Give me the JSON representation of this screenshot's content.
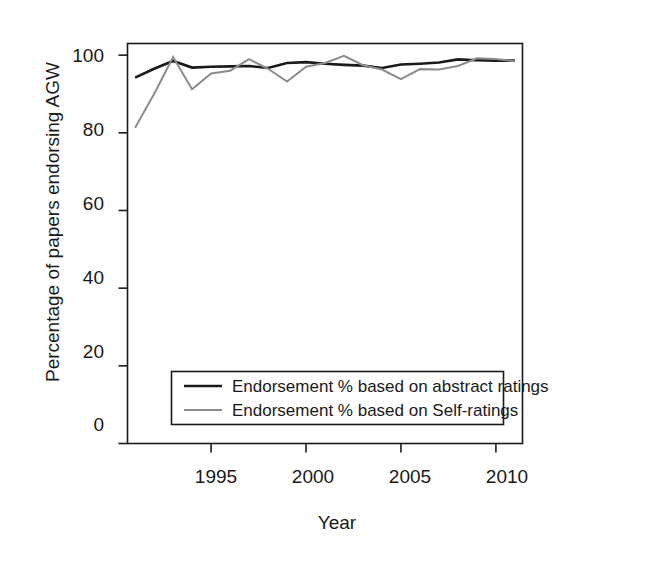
{
  "chart_data": {
    "type": "line",
    "title": "",
    "xlabel": "Year",
    "ylabel": "Percentage of papers endorsing AGW",
    "xlim": [
      1990.6,
      2011.4
    ],
    "ylim": [
      0,
      103
    ],
    "xticks": [
      1995,
      2000,
      2005,
      2010
    ],
    "yticks": [
      0,
      20,
      40,
      60,
      80,
      100
    ],
    "grid": false,
    "legend_position": "lower-center",
    "x": [
      1991,
      1992,
      1993,
      1994,
      1995,
      1996,
      1997,
      1998,
      1999,
      2000,
      2001,
      2002,
      2003,
      2004,
      2005,
      2006,
      2007,
      2008,
      2009,
      2010,
      2011
    ],
    "series": [
      {
        "name": "Endorsement % based on abstract ratings",
        "color": "#1a1a1a",
        "values": [
          94.2,
          96.5,
          98.5,
          96.8,
          97.0,
          97.1,
          97.2,
          96.7,
          98.0,
          98.2,
          97.8,
          97.5,
          97.3,
          96.7,
          97.6,
          97.8,
          98.1,
          98.9,
          98.7,
          98.6,
          98.6
        ]
      },
      {
        "name": "Endorsement % based on Self-ratings",
        "color": "#8c8c8c",
        "values": [
          81.3,
          90.0,
          99.5,
          91.2,
          95.3,
          96.0,
          99.0,
          96.5,
          93.2,
          97.0,
          98.0,
          99.8,
          97.4,
          96.3,
          93.8,
          96.4,
          96.3,
          97.2,
          99.2,
          99.0,
          98.4
        ]
      }
    ]
  },
  "legend": {
    "items": [
      {
        "label": "Endorsement % based on abstract ratings",
        "color": "#1a1a1a"
      },
      {
        "label": "Endorsement % based on Self-ratings",
        "color": "#8c8c8c"
      }
    ]
  },
  "axes": {
    "y_title": "Percentage of papers endorsing AGW",
    "x_title": "Year",
    "y_tick_labels": [
      "100",
      "80",
      "60",
      "40",
      "20",
      "0"
    ],
    "x_tick_labels": [
      "1995",
      "2000",
      "2005",
      "2010"
    ]
  }
}
